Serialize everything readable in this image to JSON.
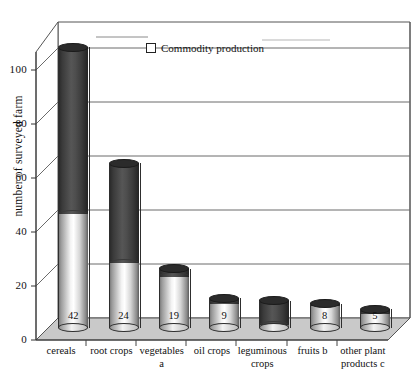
{
  "chart": {
    "type": "bar",
    "title": "",
    "ylabel": "number of surveyed farm",
    "xlabel": "",
    "legend": {
      "label": "Commodity production",
      "position": "top-center",
      "marker": "open-square"
    },
    "yticks": [
      "0",
      "20",
      "40",
      "60",
      "80",
      "100"
    ],
    "ylim": [
      0,
      110
    ],
    "grid": true,
    "style": "3d-cylinder"
  },
  "chart_data": {
    "type": "bar",
    "title": "",
    "xlabel": "",
    "ylabel": "number of surveyed farm",
    "ylim": [
      0,
      110
    ],
    "yticks": [
      0,
      20,
      40,
      60,
      80,
      100
    ],
    "grid": true,
    "legend": [
      "Commodity production"
    ],
    "categories": [
      "cereals",
      "root crops",
      "vegetables a",
      "oil crops",
      "leguminous crops",
      "fruits b",
      "other plant products c"
    ],
    "series": [
      {
        "name": "Commodity production",
        "values": [
          42,
          24,
          19,
          9,
          8,
          8,
          5
        ]
      },
      {
        "name": "Total surveyed farms",
        "values": [
          104,
          61,
          22,
          11,
          10,
          9,
          7
        ]
      }
    ],
    "data_labels": [
      "42",
      "24",
      "19",
      "9",
      "",
      "8",
      "5"
    ],
    "values": [
      42,
      24,
      19,
      9,
      8,
      8,
      5
    ],
    "totals": [
      104,
      61,
      22,
      11,
      10,
      9,
      7
    ]
  },
  "bars": [
    {
      "label_line1": "cereals",
      "label_line2": "",
      "value_label": "42",
      "light": 42,
      "total": 104
    },
    {
      "label_line1": "root crops",
      "label_line2": "",
      "value_label": "24",
      "light": 24,
      "total": 61
    },
    {
      "label_line1": "vegetables",
      "label_line2": "a",
      "value_label": "19",
      "light": 19,
      "total": 22
    },
    {
      "label_line1": "oil crops",
      "label_line2": "",
      "value_label": "9",
      "light": 9,
      "total": 11
    },
    {
      "label_line1": "leguminous",
      "label_line2": "crops",
      "value_label": "",
      "light": 1,
      "total": 10
    },
    {
      "label_line1": "fruits b",
      "label_line2": "",
      "value_label": "8",
      "light": 8,
      "total": 9
    },
    {
      "label_line1": "other plant",
      "label_line2": "products c",
      "value_label": "5",
      "light": 5,
      "total": 7
    }
  ],
  "colors": {
    "light_fill": "#f0f0f0",
    "dark_fill": "#3a3a3a",
    "floor": "#c9c9c9",
    "wall": "#ffffff",
    "gridline": "#6b6b6b",
    "text": "#111111"
  }
}
